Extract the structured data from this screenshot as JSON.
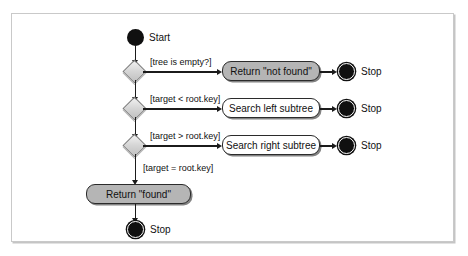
{
  "diagram": {
    "frame": {
      "border_color": "#c9c9c9",
      "background": "#ffffff"
    },
    "colors": {
      "node_fill": "#101010",
      "decision_fill": "#d6d6d6",
      "decision_border": "#7d7d7d",
      "action_border": "#2b2b2b",
      "action_fill_white": "#ffffff",
      "action_fill_shaded": "#b5b5b5",
      "connector": "#1b1b1b"
    },
    "start": {
      "label": "Start"
    },
    "decisions": [
      {
        "guard": "[tree is empty?]"
      },
      {
        "guard": "[target < root.key]"
      },
      {
        "guard": "[target > root.key]"
      },
      {
        "guard": "[target = root.key]"
      }
    ],
    "actions": [
      {
        "label": "Return \"not found\"",
        "shaded": true
      },
      {
        "label": "Search left subtree",
        "shaded": false
      },
      {
        "label": "Search right subtree",
        "shaded": false
      },
      {
        "label": "Return \"found\"",
        "shaded": true
      }
    ],
    "stops": [
      {
        "label": "Stop"
      },
      {
        "label": "Stop"
      },
      {
        "label": "Stop"
      },
      {
        "label": "Stop"
      }
    ]
  }
}
